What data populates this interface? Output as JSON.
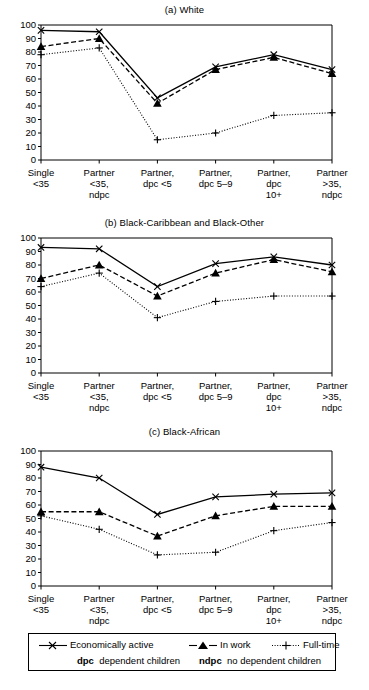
{
  "figure": {
    "categories": [
      [
        "Single",
        "<35"
      ],
      [
        "Partner",
        "<35,",
        "ndpc"
      ],
      [
        "Partner,",
        "dpc <5"
      ],
      [
        "Partner,",
        "dpc 5–9"
      ],
      [
        "Partner,",
        "dpc",
        "10+"
      ],
      [
        "Partner",
        ">35,",
        "ndpc"
      ]
    ],
    "y_ticks": [
      0,
      10,
      20,
      30,
      40,
      50,
      60,
      70,
      80,
      90,
      100
    ],
    "colors": {
      "ink": "#000000",
      "background": "#ffffff"
    }
  },
  "legend": {
    "items": [
      {
        "label": "Economically active",
        "marker": "x-marker-icon",
        "line": "solid"
      },
      {
        "label": "In work",
        "marker": "triangle-marker-icon",
        "line": "dashed"
      },
      {
        "label": "Full-time",
        "marker": "plus-marker-icon",
        "line": "dotted"
      }
    ],
    "notes": [
      {
        "abbr": "dpc",
        "text": "dependent children"
      },
      {
        "abbr": "ndpc",
        "text": "no dependent children"
      }
    ]
  },
  "chart_data": [
    {
      "type": "line",
      "title": "(a) White",
      "xlabel": "",
      "ylabel": "",
      "ylim": [
        0,
        100
      ],
      "grid": false,
      "legend_position": "below-figure",
      "categories": [
        "Single <35",
        "Partner <35, ndpc",
        "Partner, dpc <5",
        "Partner, dpc 5-9",
        "Partner, dpc 10+",
        "Partner >35, ndpc"
      ],
      "series": [
        {
          "name": "Economically active",
          "values": [
            96,
            95,
            46,
            69,
            78,
            67
          ]
        },
        {
          "name": "In work",
          "values": [
            84,
            90,
            42,
            67,
            76,
            64
          ]
        },
        {
          "name": "Full-time",
          "values": [
            78,
            83,
            15,
            20,
            33,
            35
          ]
        }
      ]
    },
    {
      "type": "line",
      "title": "(b) Black-Caribbean and Black-Other",
      "xlabel": "",
      "ylabel": "",
      "ylim": [
        0,
        100
      ],
      "grid": false,
      "legend_position": "below-figure",
      "categories": [
        "Single <35",
        "Partner <35, ndpc",
        "Partner, dpc <5",
        "Partner, dpc 5-9",
        "Partner, dpc 10+",
        "Partner >35, ndpc"
      ],
      "series": [
        {
          "name": "Economically active",
          "values": [
            93,
            92,
            64,
            81,
            86,
            80
          ]
        },
        {
          "name": "In work",
          "values": [
            70,
            80,
            57,
            74,
            84,
            75
          ]
        },
        {
          "name": "Full-time",
          "values": [
            64,
            74,
            41,
            53,
            57,
            57
          ]
        }
      ]
    },
    {
      "type": "line",
      "title": "(c) Black-African",
      "xlabel": "",
      "ylabel": "",
      "ylim": [
        0,
        100
      ],
      "grid": false,
      "legend_position": "below-figure",
      "categories": [
        "Single <35",
        "Partner <35, ndpc",
        "Partner, dpc <5",
        "Partner, dpc 5-9",
        "Partner, dpc 10+",
        "Partner >35, ndpc"
      ],
      "series": [
        {
          "name": "Economically active",
          "values": [
            88,
            80,
            53,
            66,
            68,
            69
          ]
        },
        {
          "name": "In work",
          "values": [
            55,
            55,
            37,
            52,
            59,
            59
          ]
        },
        {
          "name": "Full-time",
          "values": [
            52,
            42,
            23,
            25,
            41,
            47
          ]
        }
      ]
    }
  ]
}
